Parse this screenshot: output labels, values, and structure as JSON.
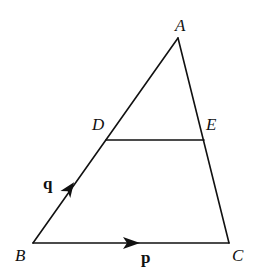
{
  "diagram": {
    "type": "geometry-triangle",
    "stroke_color": "#111111",
    "background": "#ffffff",
    "points": {
      "A": {
        "label": "A",
        "x": 178,
        "y": 38
      },
      "B": {
        "label": "B",
        "x": 33,
        "y": 243
      },
      "C": {
        "label": "C",
        "x": 229,
        "y": 243
      },
      "D": {
        "label": "D",
        "x": 106,
        "y": 140
      },
      "E": {
        "label": "E",
        "x": 204,
        "y": 140
      }
    },
    "segments": [
      {
        "from": "A",
        "to": "B"
      },
      {
        "from": "A",
        "to": "C"
      },
      {
        "from": "B",
        "to": "C"
      },
      {
        "from": "D",
        "to": "E"
      }
    ],
    "vectors": {
      "p": {
        "label": "p",
        "from": "B",
        "to": "C",
        "style": "bold"
      },
      "q": {
        "label": "q",
        "from": "B",
        "to": "D",
        "style": "bold"
      }
    }
  }
}
